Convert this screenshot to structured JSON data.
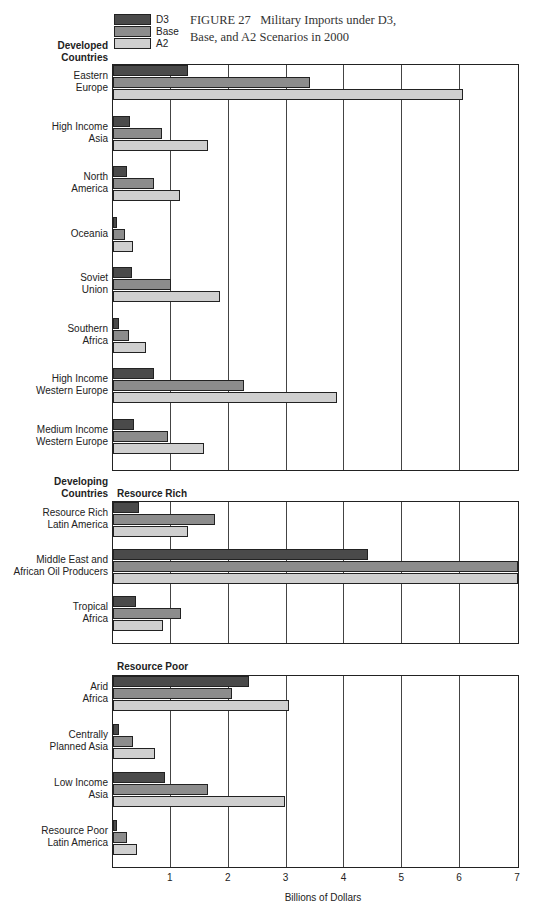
{
  "chart_data": {
    "type": "bar",
    "orientation": "horizontal",
    "title": "FIGURE 27 Military Imports under D3, Base, and A2 Scenarios in 2000",
    "xlabel": "Billions of Dollars",
    "ylabel": "",
    "xlim": [
      0,
      7
    ],
    "xticks": [
      1,
      2,
      3,
      4,
      5,
      6,
      7
    ],
    "grid": true,
    "legend_position": "top-left",
    "legend": [
      "D3",
      "Base",
      "A2"
    ],
    "colors": {
      "D3": "#4a4a4a",
      "Base": "#8c8c8c",
      "A2": "#cfcfcf"
    },
    "groups": [
      {
        "name": "Developed Countries",
        "subgroup": "",
        "categories": [
          {
            "label": [
              "Eastern",
              "Europe"
            ],
            "D3": 1.3,
            "Base": 3.4,
            "A2": 6.05
          },
          {
            "label": [
              "High Income",
              "Asia"
            ],
            "D3": 0.3,
            "Base": 0.85,
            "A2": 1.65
          },
          {
            "label": [
              "North",
              "America"
            ],
            "D3": 0.25,
            "Base": 0.7,
            "A2": 1.15
          },
          {
            "label": [
              "Oceania"
            ],
            "D3": 0.07,
            "Base": 0.2,
            "A2": 0.35
          },
          {
            "label": [
              "Soviet",
              "Union"
            ],
            "D3": 0.32,
            "Base": 1.0,
            "A2": 1.85
          },
          {
            "label": [
              "Southern",
              "Africa"
            ],
            "D3": 0.1,
            "Base": 0.27,
            "A2": 0.57
          },
          {
            "label": [
              "High Income",
              "Western Europe"
            ],
            "D3": 0.7,
            "Base": 2.27,
            "A2": 3.87
          },
          {
            "label": [
              "Medium Income",
              "Western Europe"
            ],
            "D3": 0.37,
            "Base": 0.95,
            "A2": 1.57
          }
        ]
      },
      {
        "name": "Developing Countries",
        "subgroup": "Resource Rich",
        "categories": [
          {
            "label": [
              "Resource Rich",
              "Latin America"
            ],
            "D3": 0.45,
            "Base": 1.77,
            "A2": 1.3
          },
          {
            "label": [
              "Middle East and",
              "African Oil Producers"
            ],
            "D3": 4.4,
            "Base": 7.0,
            "A2": 7.0
          },
          {
            "label": [
              "Tropical",
              "Africa"
            ],
            "D3": 0.4,
            "Base": 1.17,
            "A2": 0.87
          }
        ]
      },
      {
        "name": "",
        "subgroup": "Resource Poor",
        "categories": [
          {
            "label": [
              "Arid",
              "Africa"
            ],
            "D3": 2.35,
            "Base": 2.05,
            "A2": 3.05
          },
          {
            "label": [
              "Centrally",
              "Planned Asia"
            ],
            "D3": 0.1,
            "Base": 0.35,
            "A2": 0.72
          },
          {
            "label": [
              "Low Income",
              "Asia"
            ],
            "D3": 0.9,
            "Base": 1.65,
            "A2": 2.97
          },
          {
            "label": [
              "Resource Poor",
              "Latin America"
            ],
            "D3": 0.07,
            "Base": 0.25,
            "A2": 0.42
          }
        ]
      }
    ]
  },
  "figure": {
    "title_line1": "FIGURE 27   Military Imports under D3,",
    "title_line2": "Base, and A2 Scenarios in 2000"
  },
  "legend": {
    "d3": "D3",
    "base": "Base",
    "a2": "A2"
  },
  "headers": {
    "developed_1": "Developed",
    "developed_2": "Countries",
    "developing_1": "Developing",
    "developing_2": "Countries",
    "resource_rich": "Resource Rich",
    "resource_poor": "Resource Poor"
  },
  "axis": {
    "ticks": [
      "1",
      "2",
      "3",
      "4",
      "5",
      "6",
      "7"
    ],
    "label": "Billions of Dollars"
  }
}
